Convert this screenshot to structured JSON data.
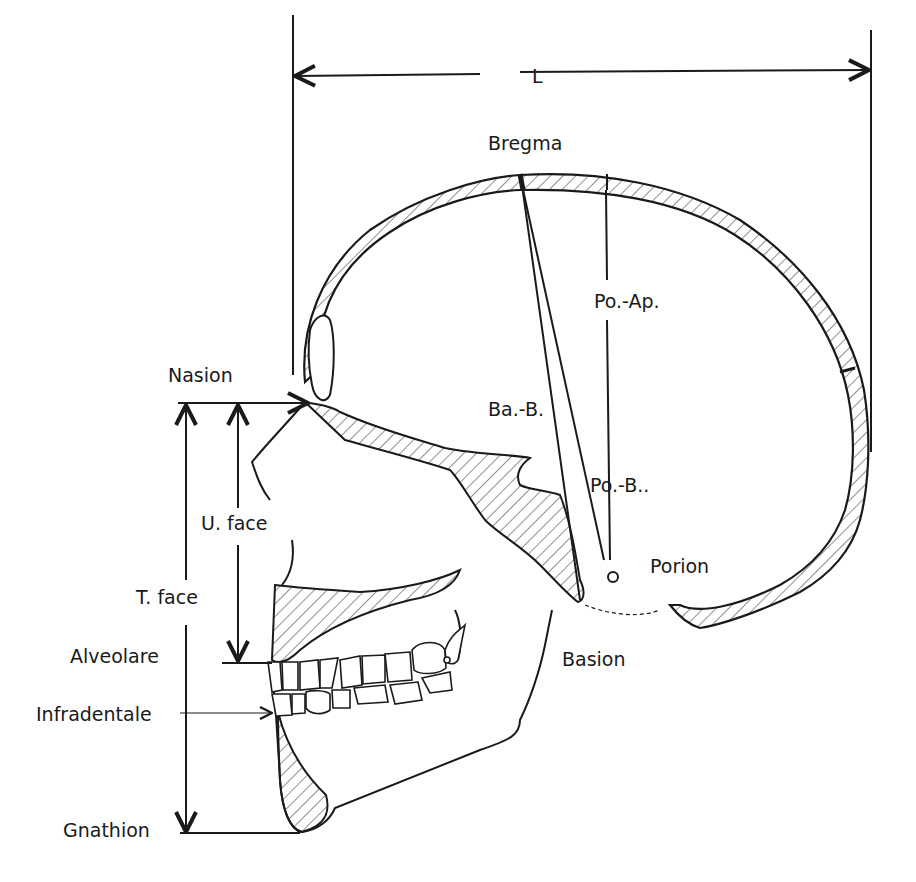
{
  "diagram": {
    "colors": {
      "ink": "#1a1a1a",
      "background": "#ffffff",
      "hatch": "#333333"
    },
    "measurements": {
      "length": "L",
      "upper_face": "U. face",
      "total_face": "T. face",
      "porion_apex": "Po.-Ap.",
      "basion_bregma": "Ba.-B.",
      "porion_bregma": "Po.-B.."
    },
    "landmarks": {
      "bregma": "Bregma",
      "nasion": "Nasion",
      "porion": "Porion",
      "basion": "Basion",
      "alveolare": "Alveolare",
      "infradentale": "Infradentale",
      "gnathion": "Gnathion"
    }
  }
}
